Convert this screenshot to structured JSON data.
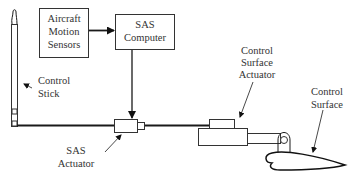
{
  "diagram": {
    "blocks": {
      "sensors": {
        "lines": [
          "Aircraft",
          "Motion",
          "Sensors"
        ]
      },
      "computer": {
        "lines": [
          "SAS",
          "Computer"
        ]
      }
    },
    "labels": {
      "control_stick": {
        "lines": [
          "Control",
          "Stick"
        ]
      },
      "sas_actuator": {
        "lines": [
          "SAS",
          "Actuator"
        ]
      },
      "cs_actuator": {
        "lines": [
          "Control",
          "Surface",
          "Actuator"
        ]
      },
      "control_surface": {
        "lines": [
          "Control",
          "Surface"
        ]
      }
    },
    "connections": [
      {
        "from": "Aircraft Motion Sensors",
        "to": "SAS Computer"
      },
      {
        "from": "SAS Computer",
        "to": "SAS Actuator"
      },
      {
        "from": "Control Stick",
        "to": "SAS Actuator"
      },
      {
        "from": "SAS Actuator",
        "to": "Control Surface Actuator"
      },
      {
        "from": "Control Surface Actuator",
        "to": "Control Surface"
      }
    ],
    "colors": {
      "stroke": "#1a1a1a",
      "text": "#333333",
      "background": "#ffffff"
    }
  }
}
